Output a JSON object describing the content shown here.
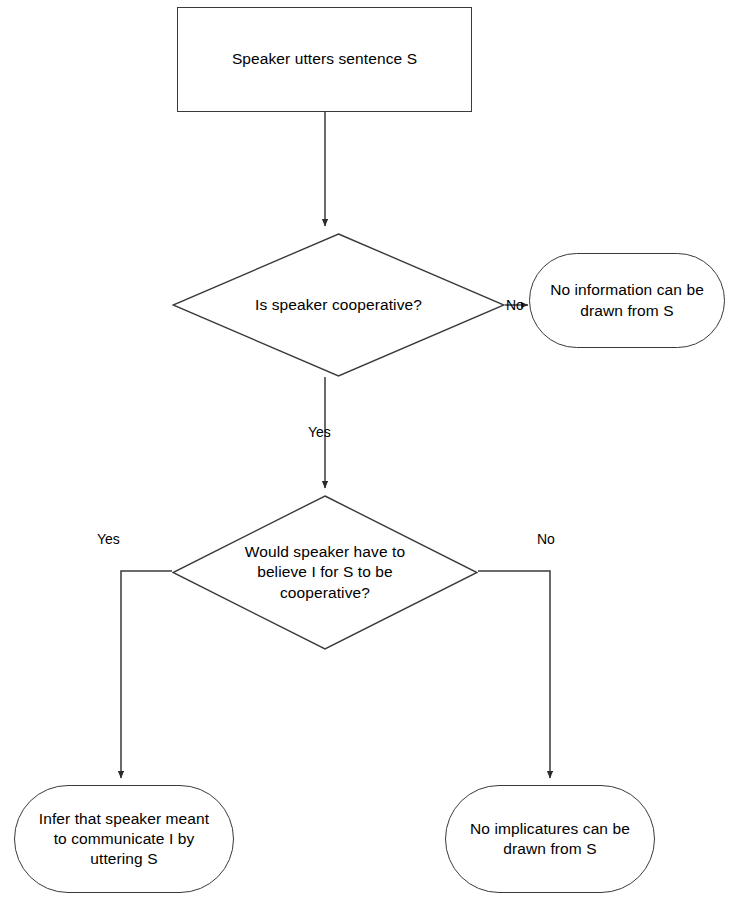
{
  "diagram": {
    "background_color": "#ffffff",
    "line_color": "#3a3a3a",
    "text_color": "#000000"
  },
  "nodes": {
    "start": {
      "label": "Speaker utters sentence S",
      "shape": "rectangle"
    },
    "decision_cooperative": {
      "label": "Is speaker cooperative?",
      "shape": "diamond"
    },
    "no_information": {
      "label": "No information can be\ndrawn from S",
      "shape": "stadium"
    },
    "decision_believe": {
      "label": "Would speaker have to\nbelieve I for S to be\ncooperative?",
      "shape": "diamond"
    },
    "infer_meant": {
      "label": "Infer that speaker meant\nto communicate I by\nuttering S",
      "shape": "stadium"
    },
    "no_implicatures": {
      "label": "No implicatures can be\ndrawn from S",
      "shape": "stadium"
    }
  },
  "edge_labels": {
    "cooperative_no": "No",
    "cooperative_yes": "Yes",
    "believe_yes": "Yes",
    "believe_no": "No"
  }
}
